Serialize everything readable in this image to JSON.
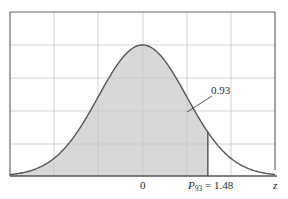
{
  "chart_data": {
    "type": "area",
    "title": "",
    "xlabel": "z",
    "ylabel": "",
    "distribution": "standard normal",
    "x_range": [
      -3,
      3
    ],
    "grid": true,
    "shaded_region": {
      "from": "-inf",
      "to": 1.48,
      "area": 0.93
    },
    "annotations": [
      {
        "text": "0.93",
        "role": "shaded-area-label"
      },
      {
        "text": "0",
        "role": "mean-tick"
      },
      {
        "text": "P93 = 1.48",
        "role": "percentile-tick",
        "subscript": "93",
        "value": 1.48
      }
    ]
  },
  "labels": {
    "area": "0.93",
    "zero": "0",
    "p_symbol": "P",
    "p_sub": "93",
    "p_value": " = 1.48",
    "axis": "z"
  },
  "colors": {
    "shade": "#d8d8d8",
    "curve": "#555555",
    "grid": "#c8c8c8",
    "frame": "#666666"
  }
}
